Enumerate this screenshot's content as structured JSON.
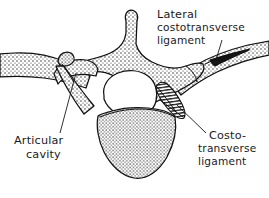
{
  "figure": {
    "kind": "anatomical-line-drawing",
    "style": "stippled pen-and-ink illustration with hand-lettered labels",
    "width": 269,
    "height": 198,
    "background_color": "#ffffff",
    "ink_color": "#111111",
    "label_color": "#1a1a1a"
  },
  "labels": {
    "lateral_costotransverse": {
      "line_1": "Lateral",
      "line_2": "costotransverse",
      "line_3": "ligament"
    },
    "costotransverse": {
      "line_1": "Costo-",
      "line_2": "transverse",
      "line_3": "ligament"
    },
    "articular_cavity": {
      "line_1": "Articular",
      "line_2": "cavity"
    }
  },
  "structures": [
    {
      "name": "spinous-process",
      "shading": "stipple"
    },
    {
      "name": "vertebral-foramen",
      "shading": "none"
    },
    {
      "name": "vertebral-body",
      "shading": "stipple"
    },
    {
      "name": "left-transverse-process",
      "shading": "stipple"
    },
    {
      "name": "right-transverse-process",
      "shading": "stipple"
    },
    {
      "name": "left-rib",
      "shading": "stipple"
    },
    {
      "name": "right-rib",
      "shading": "stipple"
    },
    {
      "name": "left-superior-articular-process",
      "shading": "stipple"
    },
    {
      "name": "costotransverse-ligament-body",
      "shading": "hatched"
    },
    {
      "name": "lateral-costotransverse-ligament-body",
      "shading": "solid-dark"
    }
  ]
}
